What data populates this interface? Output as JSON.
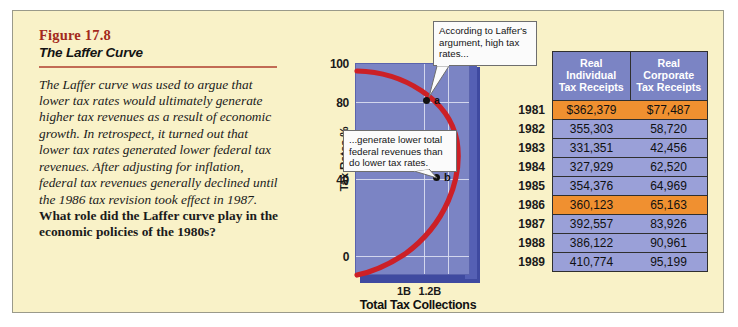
{
  "figure": {
    "number": "Figure 17.8",
    "title": "The Laffer Curve",
    "body_text": "The Laffer curve was used to argue that lower tax rates would ultimately generate higher tax revenues as a result of economic growth. In retrospect, it turned out that lower tax rates generated lower federal tax revenues. After adjusting for inflation, federal tax revenues generally declined until the 1986 tax revision took effect in 1987.",
    "body_question": "What role did the Laffer curve play in the economic policies of the 1980s?"
  },
  "chart_data": {
    "type": "line",
    "title": "The Laffer Curve",
    "xlabel": "Total Tax Collections",
    "ylabel": "Tax Rates %",
    "ylim": [
      0,
      110
    ],
    "yticks": [
      "100",
      "80",
      "40",
      "0"
    ],
    "xticks": [
      "1B",
      "1.2B"
    ],
    "grid": true,
    "curve_description": "Backward-bending Laffer curve: tax revenue rises then falls as tax rates increase",
    "points": [
      {
        "label": "a",
        "tax_rate": 80,
        "collections": "1B"
      },
      {
        "label": "b",
        "tax_rate": 40,
        "collections": "1.2B"
      }
    ],
    "series": [
      {
        "name": "Laffer curve",
        "color": "#cc2026",
        "x": [
          0.0,
          0.28,
          0.62,
          0.88,
          1.0,
          1.12,
          1.2,
          1.18,
          1.0,
          0.62,
          0.2,
          0.0
        ],
        "y": [
          100,
          98,
          93,
          86,
          80,
          72,
          60,
          52,
          40,
          25,
          8,
          0
        ]
      }
    ],
    "callouts": [
      {
        "id": "callout-high-rates",
        "text": "According to Laffer's argument, high tax rates...",
        "points_to": "a"
      },
      {
        "id": "callout-lower-revenues",
        "text": "...generate lower total federal revenues than do lower tax rates.",
        "points_to": "b"
      }
    ],
    "plot_bg": "#7b84c4",
    "accent": "#cc2026"
  },
  "table": {
    "columns": [
      "",
      "Real Individual Tax Receipts",
      "Real Corporate Tax Receipts"
    ],
    "column_lines": [
      [
        "",
        "",
        ""
      ],
      [
        "Real",
        "Individual",
        "Tax Receipts"
      ],
      [
        "Real",
        "Corporate",
        "Tax Receipts"
      ]
    ],
    "highlight_color": "#f09030",
    "row_color": "#9aa0d8",
    "rows": [
      {
        "year": "1981",
        "individual": "$362,379",
        "corporate": "$77,487",
        "highlight": true
      },
      {
        "year": "1982",
        "individual": "355,303",
        "corporate": "58,720",
        "highlight": false
      },
      {
        "year": "1983",
        "individual": "331,351",
        "corporate": "42,456",
        "highlight": false
      },
      {
        "year": "1984",
        "individual": "327,929",
        "corporate": "62,520",
        "highlight": false
      },
      {
        "year": "1985",
        "individual": "354,376",
        "corporate": "64,969",
        "highlight": false
      },
      {
        "year": "1986",
        "individual": "360,123",
        "corporate": "65,163",
        "highlight": true
      },
      {
        "year": "1987",
        "individual": "392,557",
        "corporate": "83,926",
        "highlight": false
      },
      {
        "year": "1988",
        "individual": "386,122",
        "corporate": "90,961",
        "highlight": false
      },
      {
        "year": "1989",
        "individual": "410,774",
        "corporate": "95,199",
        "highlight": false
      }
    ]
  }
}
